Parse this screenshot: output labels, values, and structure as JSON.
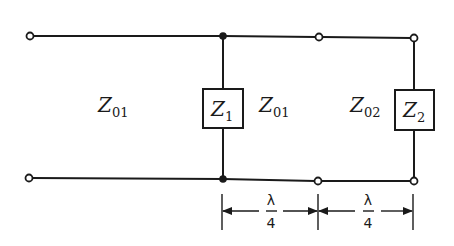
{
  "diagram": {
    "type": "transmission-line-circuit",
    "labels": {
      "line1_left": {
        "main": "Z",
        "sub": "01"
      },
      "z1": {
        "main": "Z",
        "sub": "1"
      },
      "line1_mid": {
        "main": "Z",
        "sub": "01"
      },
      "line2": {
        "main": "Z",
        "sub": "02"
      },
      "z2": {
        "main": "Z",
        "sub": "2"
      }
    },
    "dimensions": [
      {
        "numerator": "λ",
        "denominator": "4"
      },
      {
        "numerator": "λ",
        "denominator": "4"
      }
    ],
    "colors": {
      "ink": "#1a1a1a",
      "background": "#ffffff"
    }
  }
}
